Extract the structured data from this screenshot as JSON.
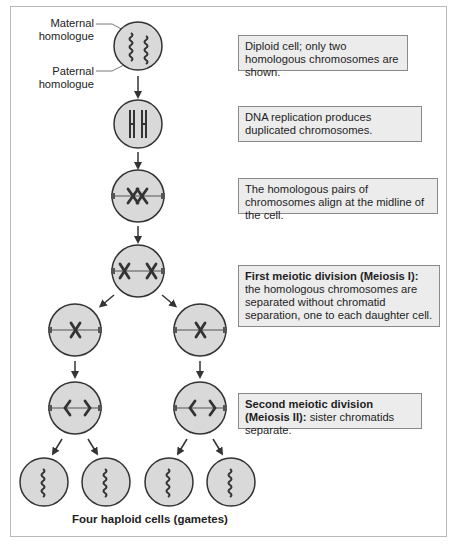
{
  "labels": {
    "maternal": "Maternal homologue",
    "maternal_line1": "Maternal",
    "maternal_line2": "homologue",
    "paternal_line1": "Paternal",
    "paternal_line2": "homologue"
  },
  "notes": [
    {
      "bold": "",
      "text": "Diploid cell; only two homologous chromosomes are shown."
    },
    {
      "bold": "",
      "text": "DNA replication produces duplicated chromosomes."
    },
    {
      "bold": "",
      "text": "The homologous pairs of chromosomes align at the midline of the cell."
    },
    {
      "bold": "First meiotic division (Meiosis I):",
      "text": " the homologous chromosomes are separated without chromatid separation, one to each daughter cell."
    },
    {
      "bold": "Second meiotic division (Meiosis II):",
      "text": " sister chromatids separate."
    }
  ],
  "caption": "Four haploid cells (gametes)",
  "colors": {
    "cell_fill": "#d9d9d9",
    "cell_stroke": "#3a3a3a",
    "chromosome": "#3a3a3a",
    "note_fill": "#ececec",
    "note_border": "#8a8a8a"
  }
}
